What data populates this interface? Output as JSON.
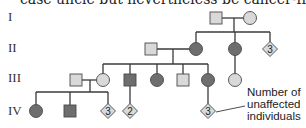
{
  "caption": "case uncle but nevertheless be cancer-free?",
  "colors": {
    "affected": "#6e6e6e",
    "unaffected": "#d9d9d9",
    "outline": "#4a4a4a",
    "line": "#3a3a3a"
  },
  "generations": [
    "I",
    "II",
    "III",
    "IV"
  ],
  "legend": {
    "lines": [
      "Number of",
      "unaffected",
      "individuals"
    ]
  },
  "individuals": [
    {
      "id": "I-1",
      "gen": "I",
      "sex": "male",
      "status": "unaffected"
    },
    {
      "id": "I-2",
      "gen": "I",
      "sex": "female",
      "status": "unaffected"
    },
    {
      "id": "II-1",
      "gen": "II",
      "sex": "male",
      "status": "unaffected"
    },
    {
      "id": "II-2",
      "gen": "II",
      "sex": "female",
      "status": "affected"
    },
    {
      "id": "II-3",
      "gen": "II",
      "sex": "female",
      "status": "affected"
    },
    {
      "id": "II-4",
      "gen": "II",
      "sex": "unknown",
      "status": "unaffected",
      "count": "3"
    },
    {
      "id": "III-1",
      "gen": "III",
      "sex": "male",
      "status": "unaffected"
    },
    {
      "id": "III-2",
      "gen": "III",
      "sex": "female",
      "status": "unaffected"
    },
    {
      "id": "III-3",
      "gen": "III",
      "sex": "male",
      "status": "affected"
    },
    {
      "id": "III-4",
      "gen": "III",
      "sex": "female",
      "status": "affected"
    },
    {
      "id": "III-5",
      "gen": "III",
      "sex": "male",
      "status": "unaffected"
    },
    {
      "id": "III-6",
      "gen": "III",
      "sex": "female",
      "status": "affected"
    },
    {
      "id": "III-7",
      "gen": "III",
      "sex": "female",
      "status": "unaffected"
    },
    {
      "id": "IV-1",
      "gen": "IV",
      "sex": "female",
      "status": "affected"
    },
    {
      "id": "IV-2",
      "gen": "IV",
      "sex": "male",
      "status": "affected"
    },
    {
      "id": "IV-3",
      "gen": "IV",
      "sex": "unknown",
      "status": "unaffected",
      "count": "3"
    },
    {
      "id": "IV-4",
      "gen": "IV",
      "sex": "unknown",
      "status": "unaffected",
      "count": "2"
    },
    {
      "id": "IV-5",
      "gen": "IV",
      "sex": "unknown",
      "status": "unaffected",
      "count": "3"
    }
  ]
}
